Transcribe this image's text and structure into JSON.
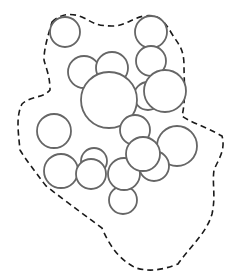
{
  "diagram": {
    "title": "",
    "boundary": {
      "style": "dashed",
      "color": "#1a1a1a",
      "path": "M 52 22 C 60 14, 72 12, 84 18 C 92 22, 96 26, 112 26 C 126 26, 132 18, 144 16 C 158 14, 164 20, 172 34 C 178 44, 184 48, 184 66 C 184 80, 186 100, 182 116 C 190 122, 204 126, 222 136 C 226 150, 218 160, 214 170 C 212 184, 216 196, 212 214 C 206 234, 192 244, 178 264 C 162 270, 150 272, 136 268 C 124 262, 112 252, 102 228 C 86 216, 72 206, 46 186 C 34 170, 26 160, 20 150 C 18 130, 16 116, 22 104 C 30 96, 44 98, 50 90 C 50 76, 46 68, 44 60 C 44 48, 48 36, 52 22 Z"
    },
    "circle_style": {
      "stroke": "#666666",
      "fill": "#ffffff"
    },
    "circles": [
      {
        "cx": 65,
        "cy": 32,
        "r": 15
      },
      {
        "cx": 151,
        "cy": 32,
        "r": 16
      },
      {
        "cx": 151,
        "cy": 61,
        "r": 15
      },
      {
        "cx": 84,
        "cy": 72,
        "r": 16
      },
      {
        "cx": 112,
        "cy": 68,
        "r": 16
      },
      {
        "cx": 148,
        "cy": 96,
        "r": 14
      },
      {
        "cx": 109,
        "cy": 100,
        "r": 28
      },
      {
        "cx": 165,
        "cy": 91,
        "r": 21
      },
      {
        "cx": 54,
        "cy": 131,
        "r": 17
      },
      {
        "cx": 135,
        "cy": 130,
        "r": 15
      },
      {
        "cx": 177,
        "cy": 146,
        "r": 20
      },
      {
        "cx": 94,
        "cy": 161,
        "r": 13
      },
      {
        "cx": 154,
        "cy": 166,
        "r": 15
      },
      {
        "cx": 61,
        "cy": 171,
        "r": 17
      },
      {
        "cx": 91,
        "cy": 174,
        "r": 15
      },
      {
        "cx": 123,
        "cy": 200,
        "r": 14
      },
      {
        "cx": 124,
        "cy": 174,
        "r": 16
      },
      {
        "cx": 143,
        "cy": 154,
        "r": 17
      }
    ]
  }
}
